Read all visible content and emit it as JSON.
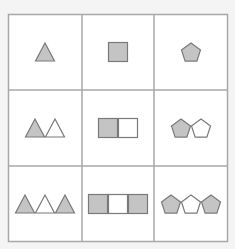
{
  "puzzle": {
    "type": "3x3 shape progression grid",
    "rows": 3,
    "cols": 3,
    "colors": {
      "background": "#f4f4f4",
      "cell_fill": "#ffffff",
      "grid_line": "#a8a8a8",
      "shape_fill_gray": "#c4c4c4",
      "shape_fill_white": "#ffffff",
      "shape_outline": "#7a7a7a"
    },
    "cells": [
      {
        "row": 0,
        "col": 0,
        "shape": "triangle",
        "fills": [
          "gray"
        ]
      },
      {
        "row": 0,
        "col": 1,
        "shape": "square",
        "fills": [
          "gray"
        ]
      },
      {
        "row": 0,
        "col": 2,
        "shape": "pentagon",
        "fills": [
          "gray"
        ]
      },
      {
        "row": 1,
        "col": 0,
        "shape": "triangle",
        "fills": [
          "gray",
          "white"
        ]
      },
      {
        "row": 1,
        "col": 1,
        "shape": "square",
        "fills": [
          "gray",
          "white"
        ]
      },
      {
        "row": 1,
        "col": 2,
        "shape": "pentagon",
        "fills": [
          "gray",
          "white"
        ]
      },
      {
        "row": 2,
        "col": 0,
        "shape": "triangle",
        "fills": [
          "gray",
          "white",
          "gray"
        ]
      },
      {
        "row": 2,
        "col": 1,
        "shape": "square",
        "fills": [
          "gray",
          "white",
          "gray"
        ]
      },
      {
        "row": 2,
        "col": 2,
        "shape": "pentagon",
        "fills": [
          "gray",
          "white",
          "gray"
        ]
      }
    ]
  }
}
